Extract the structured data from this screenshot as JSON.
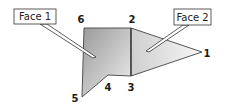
{
  "diagram": {
    "faces": [
      {
        "label": "Face 1",
        "vertices": [
          "6",
          "2",
          "3",
          "4",
          "5"
        ]
      },
      {
        "label": "Face 2",
        "vertices": [
          "2",
          "1",
          "3"
        ]
      }
    ],
    "vertex_labels": {
      "v1": "1",
      "v2": "2",
      "v3": "3",
      "v4": "4",
      "v5": "5",
      "v6": "6"
    },
    "colors": {
      "face1_dark": "#9a9a9a",
      "face1_light": "#e6e6e6",
      "face2_light": "#d6d6d6",
      "face2_pale": "#f4f4f4",
      "edge": "#555555"
    }
  }
}
